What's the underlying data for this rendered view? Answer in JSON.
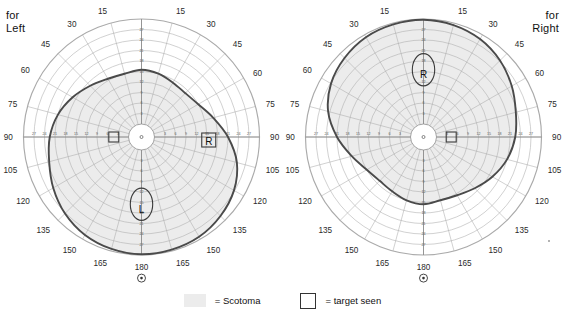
{
  "charts": [
    {
      "id": "left",
      "eye_label": "for\nLeft",
      "eye_label_align": "left",
      "mirrored": false,
      "blind_spot": {
        "marker": "oval",
        "letter": "L",
        "side": "nasal-left"
      },
      "target_seen": {
        "marker": "square",
        "letter": "R",
        "side": "temporal-right"
      }
    },
    {
      "id": "right",
      "eye_label": "for\nRight",
      "eye_label_align": "right",
      "mirrored": true,
      "blind_spot": {
        "marker": "oval",
        "letter": "R",
        "side": "nasal-right"
      },
      "target_seen": {
        "marker": "square",
        "letter": "",
        "side": "temporal-left"
      }
    }
  ],
  "axis": {
    "meridian_labels_outer": [
      "15",
      "30",
      "45",
      "60",
      "75",
      "90",
      "105",
      "120",
      "135",
      "150",
      "165",
      "180"
    ],
    "meridian_step_deg": 15,
    "radial_tick_labels": [
      "3",
      "6",
      "9",
      "12",
      "15",
      "18",
      "21",
      "24",
      "27"
    ],
    "radial_tick_max": 30,
    "center_symbol": "fixation-dot",
    "bottom_symbol": "circled-dot"
  },
  "legend": {
    "scotoma_label": "= Scotoma",
    "target_label": "= target seen",
    "scotoma_color": "#ececec",
    "target_border": "#333333"
  },
  "colors": {
    "grid": "#8d8d8d",
    "grid_light": "#aaaaaa",
    "isopter": "#4a4a4a",
    "scotoma_fill": "#ececec",
    "text": "#1a1a1a"
  },
  "chart_data": {
    "type": "line",
    "subtype": "polar-visual-field-perimetry",
    "title": "",
    "xlabel": "",
    "ylabel": "",
    "theta_unit": "degrees",
    "r_unit": "degrees of eccentricity",
    "rlim": [
      0,
      30
    ],
    "grid": true,
    "legend_position": "bottom-center",
    "theta_ticks": [
      0,
      15,
      30,
      45,
      60,
      75,
      90,
      105,
      120,
      135,
      150,
      165,
      180,
      195,
      210,
      225,
      240,
      255,
      270,
      285,
      300,
      315,
      330,
      345
    ],
    "r_ticks": [
      3,
      6,
      9,
      12,
      15,
      18,
      21,
      24,
      27,
      30
    ],
    "series": [
      {
        "name": "Isopter (left eye)",
        "chart": "left",
        "closed": true,
        "points_polar_deg_r": [
          [
            0,
            15.5
          ],
          [
            15,
            15.0
          ],
          [
            30,
            14.2
          ],
          [
            45,
            14.0
          ],
          [
            60,
            15.0
          ],
          [
            75,
            17.5
          ],
          [
            90,
            21.0
          ],
          [
            105,
            24.5
          ],
          [
            120,
            26.8
          ],
          [
            135,
            28.2
          ],
          [
            150,
            29.2
          ],
          [
            165,
            29.6
          ],
          [
            180,
            29.8
          ],
          [
            195,
            29.4
          ],
          [
            210,
            28.6
          ],
          [
            225,
            27.2
          ],
          [
            240,
            25.4
          ],
          [
            255,
            23.6
          ],
          [
            270,
            22.5
          ],
          [
            285,
            21.0
          ],
          [
            300,
            19.0
          ],
          [
            315,
            17.0
          ],
          [
            330,
            15.5
          ],
          [
            345,
            15.0
          ]
        ]
      },
      {
        "name": "Isopter (right eye, mirrored)",
        "chart": "right",
        "closed": true,
        "points_polar_deg_r": [
          [
            0,
            29.8
          ],
          [
            15,
            29.4
          ],
          [
            30,
            28.6
          ],
          [
            45,
            27.2
          ],
          [
            60,
            25.4
          ],
          [
            75,
            23.6
          ],
          [
            90,
            22.5
          ],
          [
            105,
            21.0
          ],
          [
            120,
            19.0
          ],
          [
            135,
            17.0
          ],
          [
            150,
            15.5
          ],
          [
            165,
            15.0
          ],
          [
            180,
            15.5
          ],
          [
            195,
            15.0
          ],
          [
            210,
            14.2
          ],
          [
            225,
            14.0
          ],
          [
            240,
            15.0
          ],
          [
            255,
            17.5
          ],
          [
            270,
            21.0
          ],
          [
            285,
            24.5
          ],
          [
            300,
            26.8
          ],
          [
            315,
            28.2
          ],
          [
            330,
            29.2
          ],
          [
            345,
            29.6
          ]
        ]
      }
    ],
    "scotoma_regions": [
      {
        "chart": "left",
        "name": "blind spot",
        "center_polar_deg_r": [
          180,
          15.5
        ],
        "semi_axes_r": [
          3.2,
          4.6
        ]
      },
      {
        "chart": "right",
        "name": "blind spot",
        "center_polar_deg_r": [
          0,
          15.5
        ],
        "semi_axes_r": [
          3.2,
          4.6
        ]
      }
    ]
  }
}
